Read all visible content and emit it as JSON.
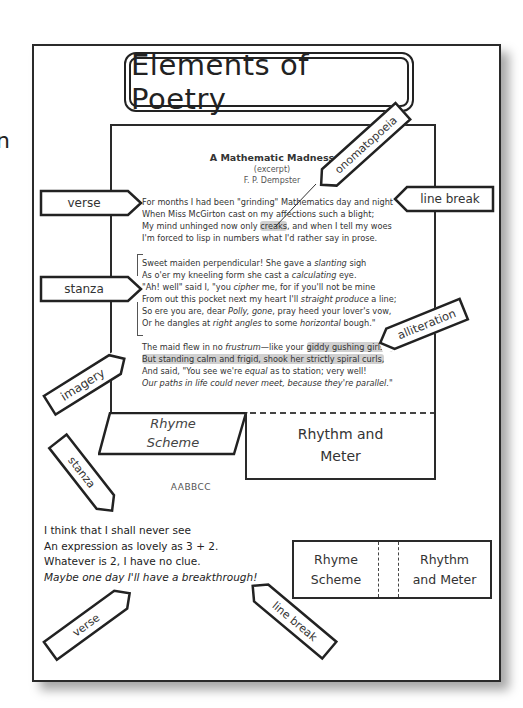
{
  "edge_fragment": "n",
  "title": "Elements of Poetry",
  "poem": {
    "title": "A Mathematic Madness",
    "subtitle": "(excerpt)",
    "author": "F. P. Dempster",
    "stanza1": [
      "For months I had been \"grinding\" Mathematics day and night",
      "When Miss McGirton cast on my affections such a blight;",
      "My mind unhinged now only ",
      "creaks",
      ", and when I tell my woes",
      "I'm forced to lisp in numbers what I'd rather say in prose."
    ],
    "stanza2": {
      "l1a": "Sweet maiden perpendicular! She gave a ",
      "l1b": "slanting",
      "l1c": " sigh",
      "l2a": "As o'er my kneeling form she cast a ",
      "l2b": "calculating",
      "l2c": " eye.",
      "l3a": "\"Ah! well\" said I, \"you ",
      "l3b": "cipher",
      "l3c": " me, for if you'll not be mine",
      "l4a": "From out this pocket next my heart I'll ",
      "l4b": "straight produce",
      "l4c": " a line;",
      "l5a": "So ere you are, dear ",
      "l5b": "Polly, gone",
      "l5c": ", pray heed your lover's vow,",
      "l6a": "Or he dangles at ",
      "l6b": "right angles",
      "l6c": " to some ",
      "l6d": "horizontal",
      "l6e": " bough.\""
    },
    "stanza3": {
      "l1a": "The maid flew in no ",
      "l1b": "frustrum",
      "l1c": "—like your ",
      "l1d": "giddy gushing girls—",
      "l2": "But standing calm and frigid, shook her strictly spiral curls,",
      "l3a": "And said, \"You see we're ",
      "l3b": "equal",
      "l3c": " as to station; very well!",
      "l4": "Our paths in life could never meet, because they're parallel.\""
    }
  },
  "tags": {
    "verse_top": "verse",
    "stanza_left": "stanza",
    "onomatopoeia": "onomatopoeia",
    "line_break_right": "line break",
    "alliteration": "alliteration",
    "imagery": "imagery",
    "stanza_lower": "stanza",
    "verse_bottom": "verse",
    "line_break_bottom": "line break"
  },
  "flaps": {
    "rhyme_scheme_line1": "Rhyme",
    "rhyme_scheme_line2": "Scheme",
    "rhyme_scheme_value": "AABBCC",
    "rhythm_line1": "Rhythm and",
    "rhythm_line2": "Meter"
  },
  "example_poem": [
    "I think that I shall never see",
    "An expression as lovely as 3 + 2.",
    "Whatever is 2, I have no clue.",
    "Maybe one day I'll have a breakthrough!"
  ],
  "comparison": {
    "left_line1": "Rhyme",
    "left_line2": "Scheme",
    "right_line1": "Rhythm",
    "right_line2": "and Meter"
  }
}
